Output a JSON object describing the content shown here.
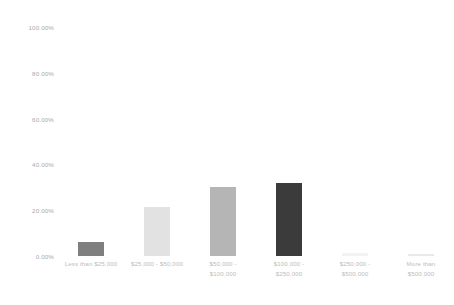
{
  "chart_data": {
    "type": "bar",
    "title": "",
    "subtitle": "",
    "xlabel": "",
    "ylabel": "",
    "ylim": [
      0,
      100
    ],
    "grid": false,
    "legend": false,
    "value_format": "percent",
    "categories": [
      "Less than $25,000",
      "$25,000 - $50,000",
      "$50,000 -\n$100,000",
      "$100,000 -\n$250,000",
      "$250,000 -\n$500,000",
      "More than\n$500,000"
    ],
    "values": [
      6.0,
      21.5,
      30.0,
      32.0,
      1.5,
      1.0
    ],
    "bar_colors": [
      "#7f7f7f",
      "#e2e2e2",
      "#b5b5b5",
      "#3b3b3b",
      "#f3f3f3",
      "#e9e9e9"
    ],
    "y_ticks": [
      0,
      20,
      40,
      60,
      80,
      100
    ],
    "y_tick_labels": [
      "0.00%",
      "20.00%",
      "40.00%",
      "60.00%",
      "80.00%",
      "100.00%"
    ],
    "axis_label_color": "#a9a9a9",
    "category_label_color": "#bdbdbd",
    "background_color": "#ffffff"
  }
}
